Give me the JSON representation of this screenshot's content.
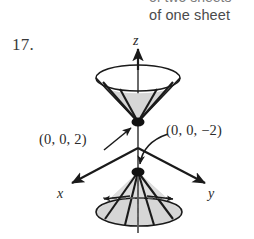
{
  "page": {
    "width": 254,
    "height": 239,
    "background": "#ffffff",
    "ink_color": "#1a1a1a",
    "shade_color": "#d6d6d6",
    "text_color": "#2b2b2b"
  },
  "caption": {
    "clipped_line_above": "of two sheets",
    "visible_line": "of one sheet"
  },
  "exercise": {
    "number_label": "17."
  },
  "figure": {
    "name": "double-cone-3d-plot",
    "axes": {
      "z_label": "z",
      "x_label": "x",
      "y_label": "y"
    },
    "annotations": [
      {
        "id": "vertex-top",
        "text": "(0, 0, 2)",
        "points_to": "upper cone vertex"
      },
      {
        "id": "vertex-bottom",
        "text": "(0, 0, −2)",
        "points_to": "lower cone vertex"
      }
    ],
    "surface": {
      "type": "double elliptic cone",
      "upper_nappe": {
        "rim_center": [
          138,
          78
        ],
        "rim_rx": 42,
        "rim_ry": 13,
        "apex": [
          138,
          122
        ],
        "ruling_count": 4,
        "shaded": true
      },
      "lower_nappe": {
        "rim_center": [
          139,
          212
        ],
        "rim_rx": 43,
        "rim_ry": 14,
        "apex": [
          138,
          172
        ],
        "ruling_count": 4,
        "shaded": true
      }
    }
  }
}
